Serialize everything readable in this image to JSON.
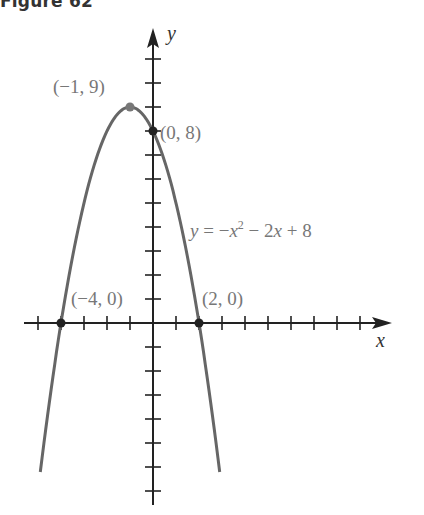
{
  "figure": {
    "title": "Figure 62"
  },
  "chart_data": {
    "type": "line",
    "title": "Figure 62",
    "equation": "y = −x² − 2x + 8",
    "xlabel": "x",
    "ylabel": "y",
    "xlim": [
      -5.5,
      10.5
    ],
    "ylim": [
      -7.5,
      11.5
    ],
    "grid": false,
    "x_ticks": [
      -5,
      -4,
      -3,
      -2,
      -1,
      1,
      2,
      3,
      4,
      5,
      6,
      7,
      8,
      9
    ],
    "y_ticks": [
      -7,
      -6,
      -5,
      -4,
      -3,
      -2,
      -1,
      1,
      2,
      3,
      4,
      5,
      6,
      7,
      8,
      9,
      10,
      11
    ],
    "series": [
      {
        "name": "y = −x² − 2x + 8",
        "x": [
          -4.9,
          -4.5,
          -4,
          -3.5,
          -3,
          -2.5,
          -2,
          -1.5,
          -1,
          -0.5,
          0,
          0.5,
          1,
          1.5,
          2,
          2.5,
          2.9
        ],
        "y": [
          -6.21,
          -3.25,
          0,
          2.75,
          5,
          6.75,
          8,
          8.75,
          9,
          8.75,
          8,
          6.75,
          5,
          2.75,
          0,
          -3.25,
          -6.21
        ]
      }
    ],
    "annotations": [
      {
        "label": "(−1, 9)",
        "x": -1,
        "y": 9,
        "note": "vertex"
      },
      {
        "label": "(0, 8)",
        "x": 0,
        "y": 8,
        "note": "y-intercept"
      },
      {
        "label": "(−4, 0)",
        "x": -4,
        "y": 0,
        "note": "x-intercept"
      },
      {
        "label": "(2, 0)",
        "x": 2,
        "y": 0,
        "note": "x-intercept"
      }
    ]
  },
  "labels": {
    "vertex": "(−1, 9)",
    "y_intercept": "(0, 8)",
    "x_intercept_left": "(−4, 0)",
    "x_intercept_right": "(2, 0)",
    "equation_lhs": "y",
    "equation_rhs_1": " = −",
    "equation_x": "x",
    "equation_sup": "2",
    "equation_rhs_2": " − 2",
    "equation_x2": "x",
    "equation_rhs_3": " + 8",
    "x_axis": "x",
    "y_axis": "y"
  },
  "colors": {
    "curve": "#666666",
    "axis": "#222222",
    "labels": "#777777"
  }
}
